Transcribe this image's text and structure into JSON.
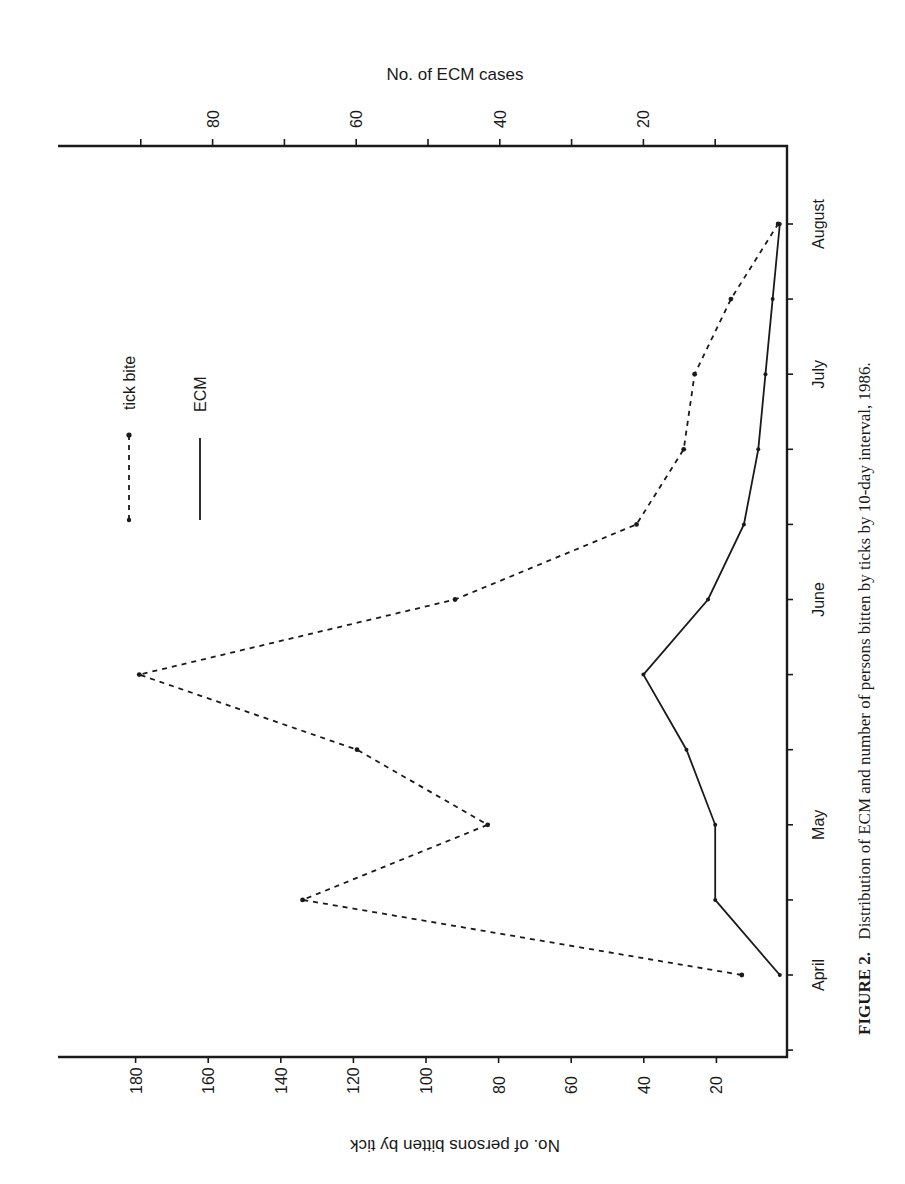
{
  "chart_data": {
    "type": "line",
    "orientation": "rotated-90",
    "title": "",
    "caption": {
      "label": "FIGURE 2.",
      "text": "Distribution of ECM and number of persons bitten by ticks by 10-day interval, 1986."
    },
    "x": [
      "April",
      "",
      "May",
      "",
      "",
      "June",
      "",
      "",
      "July",
      "",
      "August"
    ],
    "xlabel": "",
    "month_labels": [
      {
        "label": "April",
        "index": 0
      },
      {
        "label": "May",
        "index": 2
      },
      {
        "label": "June",
        "index": 5
      },
      {
        "label": "July",
        "index": 8
      },
      {
        "label": "August",
        "index": 10
      }
    ],
    "primary_axis": {
      "label": "No. of persons bitten by tick",
      "ticks": [
        20,
        40,
        60,
        80,
        100,
        120,
        140,
        160,
        180
      ],
      "range": [
        0,
        200
      ]
    },
    "secondary_axis": {
      "label": "No. of ECM cases",
      "ticks": [
        20,
        40,
        60,
        80
      ],
      "minor_ticks": [
        10,
        30,
        50,
        70,
        90
      ],
      "range": [
        0,
        90
      ]
    },
    "series": [
      {
        "name": "tick bite",
        "style": "dashed",
        "axis": "primary",
        "values": [
          13,
          134,
          83,
          119,
          179,
          92,
          42,
          29,
          26,
          16,
          3
        ]
      },
      {
        "name": "ECM",
        "style": "solid",
        "axis": "secondary",
        "values": [
          1,
          10,
          10,
          14,
          20,
          11,
          6,
          4,
          3,
          2,
          1
        ]
      }
    ],
    "legend": [
      {
        "label": "tick bite",
        "style": "dashed"
      },
      {
        "label": "ECM",
        "style": "solid"
      }
    ],
    "grid": false
  },
  "labels": {
    "secondary_axis_title": "No. of ECM cases",
    "primary_axis_title": "No. of persons bitten by tick",
    "legend_tick": "tick bite",
    "legend_ecm": "ECM",
    "caption_label": "FIGURE 2.",
    "caption_text": "Distribution of ECM and number of persons bitten by ticks by 10-day interval, 1986."
  },
  "colors": {
    "ink": "#1a1a1a",
    "background": "#ffffff"
  }
}
